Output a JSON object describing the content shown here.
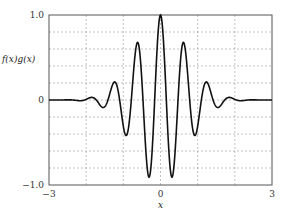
{
  "chart_data": {
    "type": "line",
    "title": "",
    "xlabel": "x",
    "ylabel": "f(x)g(x)",
    "xlim": [
      -3,
      3
    ],
    "ylim": [
      -1.0,
      1.0
    ],
    "x_ticks": [
      -3,
      0,
      3
    ],
    "x_tick_labels": [
      "−3",
      "0",
      "3"
    ],
    "y_ticks": [
      -1.0,
      0,
      1.0
    ],
    "y_tick_labels": [
      "−1.0",
      "0",
      "1.0"
    ],
    "x_grid": [
      -2,
      -1,
      0,
      1,
      2
    ],
    "y_grid": [
      -0.8,
      -0.6,
      -0.4,
      -0.2,
      0,
      0.2,
      0.4,
      0.6,
      0.8
    ],
    "grid": true,
    "series": [
      {
        "name": "f(x)g(x)",
        "color": "#111111",
        "formula": "cos(10x)*exp(-x^2)",
        "x": [
          -3,
          -2.5,
          -1.85,
          -1.55,
          -1.25,
          -0.95,
          -0.62,
          -0.32,
          0,
          0.32,
          0.62,
          0.95,
          1.25,
          1.55,
          1.85,
          2.5,
          3
        ],
        "y": [
          0,
          0,
          0.04,
          -0.12,
          0.2,
          -0.43,
          0.67,
          -0.87,
          1.0,
          -0.87,
          0.67,
          -0.43,
          0.2,
          -0.12,
          0.04,
          0,
          0
        ]
      }
    ]
  }
}
